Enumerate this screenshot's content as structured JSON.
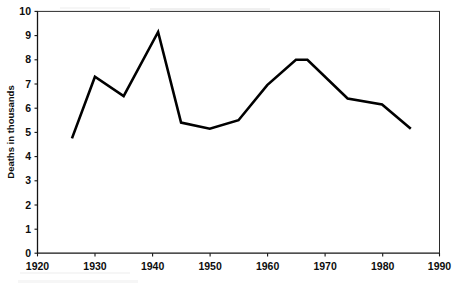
{
  "chart_data": {
    "type": "line",
    "title": "",
    "xlabel": "",
    "ylabel": "Deaths in thousands",
    "xlim": [
      1920,
      1990
    ],
    "ylim": [
      0,
      10
    ],
    "grid": false,
    "legend": "none",
    "x_ticks": [
      "1920",
      "1930",
      "1940",
      "1950",
      "1960",
      "1970",
      "1980",
      "1990"
    ],
    "x_tick_values": [
      1920,
      1930,
      1940,
      1950,
      1960,
      1970,
      1980,
      1990
    ],
    "y_ticks": [
      "0",
      "1",
      "2",
      "3",
      "4",
      "5",
      "6",
      "7",
      "8",
      "9",
      "10"
    ],
    "y_tick_values": [
      0,
      1,
      2,
      3,
      4,
      5,
      6,
      7,
      8,
      9,
      10
    ],
    "series": [
      {
        "name": "Deaths in thousands",
        "color": "#000000",
        "x": [
          1926,
          1930,
          1935,
          1941,
          1945,
          1950,
          1955,
          1960,
          1965,
          1967,
          1974,
          1980,
          1985
        ],
        "values": [
          4.75,
          7.3,
          6.5,
          9.15,
          5.4,
          5.15,
          5.5,
          6.95,
          8.0,
          8.0,
          6.4,
          6.15,
          5.15
        ]
      }
    ],
    "annotations": []
  },
  "axes": {
    "y_axis_title": "Deaths in thousands",
    "y_tick_labels": [
      "10",
      "9",
      "8",
      "7",
      "6",
      "5",
      "4",
      "3",
      "2",
      "1",
      "0"
    ],
    "x_tick_labels": [
      "1920",
      "1930",
      "1940",
      "1950",
      "1960",
      "1970",
      "1980",
      "1990"
    ]
  },
  "colors": {
    "line": "#000000",
    "axis": "#141414",
    "background": "#ffffff",
    "text": "#0d0d0d"
  }
}
